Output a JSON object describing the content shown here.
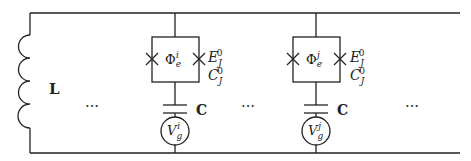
{
  "diagram": {
    "type": "circuit",
    "inductor": {
      "label": "L"
    },
    "ellipses": [
      "…",
      "…",
      "…"
    ],
    "branches": [
      {
        "index": "i",
        "flux_label": "Φ",
        "flux_sub": "e",
        "flux_sup": "i",
        "ej_label": "E",
        "ej_sub": "J",
        "ej_sup": "0",
        "cj_label": "C",
        "cj_sub": "J",
        "cj_sup": "0",
        "cap_label": "C",
        "source_label": "V",
        "source_sub": "g",
        "source_sup": "i"
      },
      {
        "index": "j",
        "flux_label": "Φ",
        "flux_sub": "e",
        "flux_sup": "j",
        "ej_label": "E",
        "ej_sub": "J",
        "ej_sup": "0",
        "cj_label": "C",
        "cj_sub": "J",
        "cj_sup": "0",
        "cap_label": "C",
        "source_label": "V",
        "source_sub": "g",
        "source_sup": "j"
      }
    ]
  }
}
